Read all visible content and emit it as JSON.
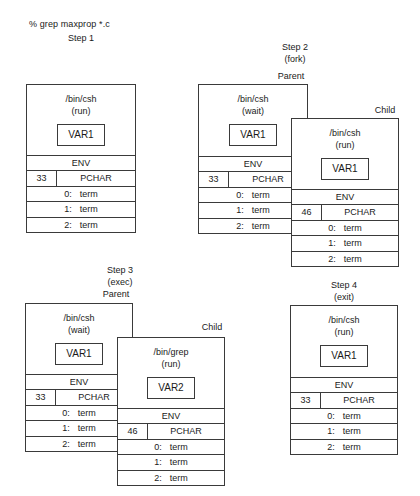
{
  "command": "% grep maxprop   *.c",
  "steps": [
    {
      "title": "Step 1",
      "subtitle": "",
      "processes": [
        {
          "role": "",
          "program": "/bin/csh",
          "state": "(run)",
          "var": "VAR1",
          "env": "ENV",
          "pid": "33",
          "pchar": "PCHAR",
          "fds": [
            {
              "num": "0:",
              "name": "term"
            },
            {
              "num": "1:",
              "name": "term"
            },
            {
              "num": "2:",
              "name": "term"
            }
          ]
        }
      ]
    },
    {
      "title": "Step 2",
      "subtitle": "(fork)",
      "processes": [
        {
          "role": "Parent",
          "program": "/bin/csh",
          "state": "(wait)",
          "var": "VAR1",
          "env": "ENV",
          "pid": "33",
          "pchar": "PCHAR",
          "fds": [
            {
              "num": "0:",
              "name": "term"
            },
            {
              "num": "1:",
              "name": "term"
            },
            {
              "num": "2:",
              "name": "term"
            }
          ]
        },
        {
          "role": "Child",
          "program": "/bin/csh",
          "state": "(run)",
          "var": "VAR1",
          "env": "ENV",
          "pid": "46",
          "pchar": "PCHAR",
          "fds": [
            {
              "num": "0:",
              "name": "term"
            },
            {
              "num": "1:",
              "name": "term"
            },
            {
              "num": "2:",
              "name": "term"
            }
          ]
        }
      ]
    },
    {
      "title": "Step 3",
      "subtitle": "(exec)",
      "processes": [
        {
          "role": "Parent",
          "program": "/bin/csh",
          "state": "(wait)",
          "var": "VAR1",
          "env": "ENV",
          "pid": "33",
          "pchar": "PCHAR",
          "fds": [
            {
              "num": "0:",
              "name": "term"
            },
            {
              "num": "1:",
              "name": "term"
            },
            {
              "num": "2:",
              "name": "term"
            }
          ]
        },
        {
          "role": "Child",
          "program": "/bin/grep",
          "state": "(run)",
          "var": "VAR2",
          "env": "ENV",
          "pid": "46",
          "pchar": "PCHAR",
          "fds": [
            {
              "num": "0:",
              "name": "term"
            },
            {
              "num": "1:",
              "name": "term"
            },
            {
              "num": "2:",
              "name": "term"
            }
          ]
        }
      ]
    },
    {
      "title": "Step 4",
      "subtitle": "(exit)",
      "processes": [
        {
          "role": "",
          "program": "/bin/csh",
          "state": "(run)",
          "var": "VAR1",
          "env": "ENV",
          "pid": "33",
          "pchar": "PCHAR",
          "fds": [
            {
              "num": "0:",
              "name": "term"
            },
            {
              "num": "1:",
              "name": "term"
            },
            {
              "num": "2:",
              "name": "term"
            }
          ]
        }
      ]
    }
  ]
}
